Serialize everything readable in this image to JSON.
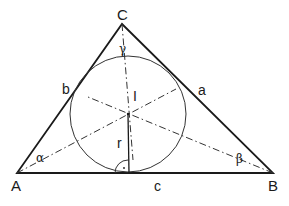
{
  "diagram": {
    "colors": {
      "stroke": "#1a1a1a",
      "background": "#ffffff"
    },
    "vertices": {
      "A": {
        "label": "A",
        "x": 17,
        "y": 173
      },
      "B": {
        "label": "B",
        "x": 273,
        "y": 173
      },
      "C": {
        "label": "C",
        "x": 122,
        "y": 24
      }
    },
    "sides": {
      "a": {
        "label": "a",
        "between": "B-C"
      },
      "b": {
        "label": "b",
        "between": "A-C"
      },
      "c": {
        "label": "c",
        "between": "A-B"
      }
    },
    "angles": {
      "alpha": {
        "label": "α",
        "vertex": "A"
      },
      "beta": {
        "label": "β",
        "vertex": "B"
      },
      "gamma": {
        "label": "γ",
        "vertex": "C"
      }
    },
    "incircle": {
      "center_label": "I",
      "radius_label": "r",
      "cx": 128,
      "cy": 114,
      "r": 58
    },
    "lines": {
      "angle_bisectors": "dash-dot",
      "radius": "solid",
      "right_angle_marker": "·"
    }
  }
}
